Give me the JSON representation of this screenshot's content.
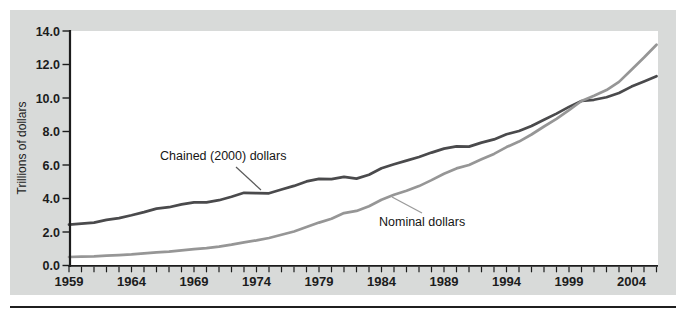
{
  "figure": {
    "ylabel": "Trillions of dollars",
    "colors": {
      "panel_bg": "#d8dad9",
      "plot_bg": "#ffffff",
      "axis": "#1c1c1c",
      "text": "#1c1c1c",
      "bottom_rule": "#1f1f1f"
    }
  },
  "chart_data": {
    "type": "line",
    "title": "",
    "xlabel": "",
    "ylabel": "Trillions of dollars",
    "ylim": [
      0,
      14
    ],
    "grid": false,
    "legend_position": "inline-annotations",
    "yticks": [
      "0.0",
      "2.0",
      "4.0",
      "6.0",
      "8.0",
      "10.0",
      "12.0",
      "14.0"
    ],
    "xticks": [
      "1959",
      "1964",
      "1969",
      "1974",
      "1979",
      "1984",
      "1989",
      "1994",
      "1999",
      "2004"
    ],
    "x": [
      1959,
      1960,
      1961,
      1962,
      1963,
      1964,
      1965,
      1966,
      1967,
      1968,
      1969,
      1970,
      1971,
      1972,
      1973,
      1974,
      1975,
      1976,
      1977,
      1978,
      1979,
      1980,
      1981,
      1982,
      1983,
      1984,
      1985,
      1986,
      1987,
      1988,
      1989,
      1990,
      1991,
      1992,
      1993,
      1994,
      1995,
      1996,
      1997,
      1998,
      1999,
      2000,
      2001,
      2002,
      2003,
      2004,
      2005,
      2006
    ],
    "series": [
      {
        "name": "Chained (2000) dollars",
        "color": "#4a4a4c",
        "line_width": 2.7,
        "values": [
          2.44,
          2.5,
          2.56,
          2.72,
          2.83,
          3.0,
          3.19,
          3.4,
          3.48,
          3.65,
          3.77,
          3.77,
          3.9,
          4.11,
          4.34,
          4.32,
          4.31,
          4.54,
          4.75,
          5.02,
          5.17,
          5.16,
          5.29,
          5.19,
          5.42,
          5.81,
          6.05,
          6.26,
          6.48,
          6.74,
          6.98,
          7.11,
          7.1,
          7.34,
          7.53,
          7.84,
          8.03,
          8.33,
          8.7,
          9.07,
          9.47,
          9.82,
          9.89,
          10.05,
          10.3,
          10.68,
          10.99,
          11.3
        ]
      },
      {
        "name": "Nominal dollars",
        "color": "#969696",
        "line_width": 2.7,
        "values": [
          0.51,
          0.53,
          0.55,
          0.59,
          0.62,
          0.66,
          0.72,
          0.79,
          0.83,
          0.91,
          0.98,
          1.04,
          1.13,
          1.24,
          1.38,
          1.5,
          1.64,
          1.83,
          2.03,
          2.29,
          2.56,
          2.79,
          3.13,
          3.26,
          3.54,
          3.93,
          4.22,
          4.46,
          4.74,
          5.1,
          5.48,
          5.8,
          6.0,
          6.34,
          6.66,
          7.07,
          7.4,
          7.82,
          8.3,
          8.75,
          9.27,
          9.82,
          10.13,
          10.47,
          10.96,
          11.69,
          12.42,
          13.18
        ]
      }
    ],
    "annotations": [
      {
        "text": "Chained (2000) dollars",
        "points_to_series": 0,
        "near_year": 1974
      },
      {
        "text": "Nominal dollars",
        "points_to_series": 1,
        "near_year": 1985
      }
    ]
  }
}
